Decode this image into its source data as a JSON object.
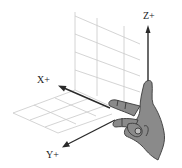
{
  "diagram": {
    "axes": [
      {
        "name": "x",
        "label": "X+"
      },
      {
        "name": "y",
        "label": "Y+"
      },
      {
        "name": "z",
        "label": "Z+"
      }
    ],
    "colors": {
      "axis": "#2a2a2a",
      "grid": "#c9c9c9",
      "hand_fill": "#8a8a8a",
      "hand_stroke": "#3a3a3a"
    }
  }
}
